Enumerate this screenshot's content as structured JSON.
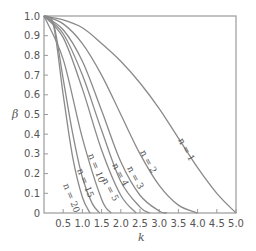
{
  "chart_data": {
    "type": "line",
    "title": "",
    "xlabel": "k",
    "ylabel": "β",
    "xlim": [
      0,
      5.0
    ],
    "ylim": [
      0,
      1.0
    ],
    "grid": false,
    "legend": "inline curve labels",
    "x_ticks": [
      "0.5",
      "1.0",
      "1.5",
      "2.0",
      "2.5",
      "3.0",
      "3.5",
      "4.0",
      "4.5",
      "5.0"
    ],
    "y_ticks": [
      "0",
      "0.1",
      "0.2",
      "0.3",
      "0.4",
      "0.5",
      "0.6",
      "0.7",
      "0.8",
      "0.9",
      "1.0"
    ],
    "series": [
      {
        "name": "n = 1",
        "label": "n = 1",
        "x": [
          0,
          0.5,
          1.0,
          1.5,
          2.0,
          2.5,
          3.0,
          3.5,
          4.0,
          4.5,
          5.0
        ],
        "values": [
          1.0,
          0.98,
          0.94,
          0.86,
          0.77,
          0.66,
          0.53,
          0.38,
          0.23,
          0.1,
          0.0
        ]
      },
      {
        "name": "n = 2",
        "label": "n = 2",
        "x": [
          0,
          0.5,
          1.0,
          1.5,
          2.0,
          2.5,
          3.0,
          3.5,
          4.0
        ],
        "values": [
          1.0,
          0.96,
          0.86,
          0.7,
          0.5,
          0.3,
          0.14,
          0.04,
          0.0
        ]
      },
      {
        "name": "n = 3",
        "label": "n = 3",
        "x": [
          0,
          0.5,
          1.0,
          1.5,
          2.0,
          2.5,
          3.0,
          3.2
        ],
        "values": [
          1.0,
          0.93,
          0.77,
          0.52,
          0.26,
          0.09,
          0.01,
          0.0
        ]
      },
      {
        "name": "n = 4",
        "label": "n = 4",
        "x": [
          0,
          0.5,
          1.0,
          1.5,
          2.0,
          2.5,
          2.75
        ],
        "values": [
          1.0,
          0.91,
          0.7,
          0.42,
          0.16,
          0.03,
          0.0
        ]
      },
      {
        "name": "n = 5",
        "label": "n = 5",
        "x": [
          0,
          0.5,
          1.0,
          1.5,
          2.0,
          2.4
        ],
        "values": [
          1.0,
          0.89,
          0.63,
          0.32,
          0.09,
          0.0
        ]
      },
      {
        "name": "n = 10",
        "label": "n = 10",
        "x": [
          0,
          0.5,
          1.0,
          1.5,
          1.75
        ],
        "values": [
          1.0,
          0.78,
          0.38,
          0.07,
          0.0
        ]
      },
      {
        "name": "n = 15",
        "label": "n = 15",
        "x": [
          0,
          0.25,
          0.5,
          0.75,
          1.0,
          1.25,
          1.45
        ],
        "values": [
          1.0,
          0.96,
          0.68,
          0.4,
          0.18,
          0.05,
          0.0
        ]
      },
      {
        "name": "n = 20",
        "label": "n = 20",
        "x": [
          0,
          0.25,
          0.5,
          0.75,
          1.0,
          1.2
        ],
        "values": [
          1.0,
          0.95,
          0.6,
          0.28,
          0.08,
          0.0
        ]
      }
    ]
  },
  "styles": {
    "line_color": "#8a8a8a",
    "axis_color": "#9a9a9a",
    "text_color": "#555555"
  }
}
